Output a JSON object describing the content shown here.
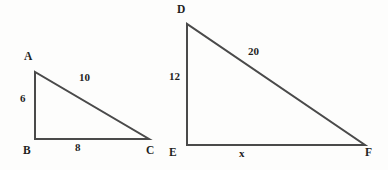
{
  "figure": {
    "stroke_color": "#4a4a4a",
    "text_color": "#1f1f1f",
    "background_color": "#fdfdfc",
    "triangles": [
      {
        "name": "triangle-abc",
        "vertices": [
          {
            "label": "A",
            "x": 35,
            "y": 72,
            "label_x": 24,
            "label_y": 50
          },
          {
            "label": "B",
            "x": 35,
            "y": 139,
            "label_x": 23,
            "label_y": 144
          },
          {
            "label": "C",
            "x": 149,
            "y": 139,
            "label_x": 146,
            "label_y": 144
          }
        ],
        "sides": [
          {
            "name": "leg-ab",
            "label": "6",
            "label_x": 20,
            "label_y": 92
          },
          {
            "name": "base-bc",
            "label": "8",
            "label_x": 75,
            "label_y": 141
          },
          {
            "name": "hypotenuse-ac",
            "label": "10",
            "label_x": 79,
            "label_y": 71
          }
        ]
      },
      {
        "name": "triangle-def",
        "vertices": [
          {
            "label": "D",
            "x": 187,
            "y": 24,
            "label_x": 177,
            "label_y": 3
          },
          {
            "label": "E",
            "x": 187,
            "y": 145,
            "label_x": 169,
            "label_y": 146
          },
          {
            "label": "F",
            "x": 365,
            "y": 145,
            "label_x": 365,
            "label_y": 146
          }
        ],
        "sides": [
          {
            "name": "leg-de",
            "label": "12",
            "label_x": 169,
            "label_y": 70
          },
          {
            "name": "base-ef",
            "label": "x",
            "label_x": 239,
            "label_y": 147
          },
          {
            "name": "hypotenuse-df",
            "label": "20",
            "label_x": 248,
            "label_y": 45
          }
        ]
      }
    ]
  }
}
